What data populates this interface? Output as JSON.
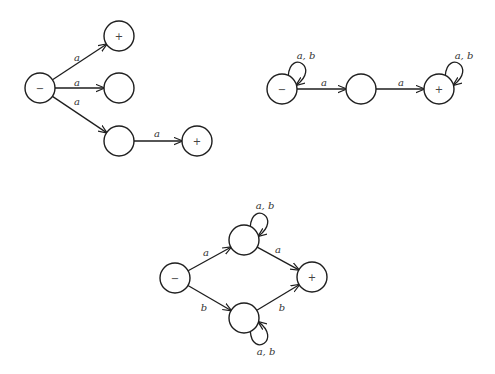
{
  "diagrams": [
    {
      "name": "nfa-1",
      "nodes": [
        {
          "id": "n1",
          "cx": 40,
          "cy": 88,
          "symbol": "−"
        },
        {
          "id": "n2",
          "cx": 119,
          "cy": 36,
          "symbol": "+"
        },
        {
          "id": "n3",
          "cx": 119,
          "cy": 88,
          "symbol": ""
        },
        {
          "id": "n4",
          "cx": 119,
          "cy": 141,
          "symbol": ""
        },
        {
          "id": "n5",
          "cx": 197,
          "cy": 141,
          "symbol": "+"
        }
      ],
      "edges": [
        {
          "from": "n1",
          "to": "n2",
          "label": "a",
          "lx": 77,
          "ly": 57
        },
        {
          "from": "n1",
          "to": "n3",
          "label": "a",
          "lx": 77,
          "ly": 82
        },
        {
          "from": "n1",
          "to": "n4",
          "label": "a",
          "lx": 77,
          "ly": 101
        },
        {
          "from": "n4",
          "to": "n5",
          "label": "a",
          "lx": 157,
          "ly": 133
        }
      ]
    },
    {
      "name": "nfa-2",
      "nodes": [
        {
          "id": "m1",
          "cx": 282,
          "cy": 89,
          "symbol": "−"
        },
        {
          "id": "m2",
          "cx": 361,
          "cy": 89,
          "symbol": ""
        },
        {
          "id": "m3",
          "cx": 439,
          "cy": 89,
          "symbol": "+"
        }
      ],
      "edges": [
        {
          "from": "m1",
          "to": "m2",
          "label": "a",
          "lx": 324,
          "ly": 82
        },
        {
          "from": "m2",
          "to": "m3",
          "label": "a",
          "lx": 401,
          "ly": 82
        }
      ],
      "loops": [
        {
          "node": "m1",
          "label": "a, b",
          "lx": 306,
          "ly": 55
        },
        {
          "node": "m3",
          "label": "a, b",
          "lx": 464,
          "ly": 55
        }
      ]
    },
    {
      "name": "nfa-3",
      "nodes": [
        {
          "id": "p1",
          "cx": 175,
          "cy": 278,
          "symbol": "−"
        },
        {
          "id": "p2",
          "cx": 244,
          "cy": 240,
          "symbol": ""
        },
        {
          "id": "p3",
          "cx": 244,
          "cy": 318,
          "symbol": ""
        },
        {
          "id": "p4",
          "cx": 312,
          "cy": 277,
          "symbol": "+"
        }
      ],
      "edges": [
        {
          "from": "p1",
          "to": "p2",
          "label": "a",
          "lx": 206,
          "ly": 252
        },
        {
          "from": "p1",
          "to": "p3",
          "label": "b",
          "lx": 204,
          "ly": 307
        },
        {
          "from": "p2",
          "to": "p4",
          "label": "a",
          "lx": 278,
          "ly": 249
        },
        {
          "from": "p3",
          "to": "p4",
          "label": "b",
          "lx": 282,
          "ly": 307
        }
      ],
      "loops": [
        {
          "node": "p2",
          "label": "a, b",
          "lx": 265,
          "ly": 205
        },
        {
          "node": "p3",
          "label": "a, b",
          "lx": 266,
          "ly": 351
        }
      ]
    }
  ],
  "style": {
    "stroke": "#1e1e1e",
    "background": "#ffffff"
  }
}
